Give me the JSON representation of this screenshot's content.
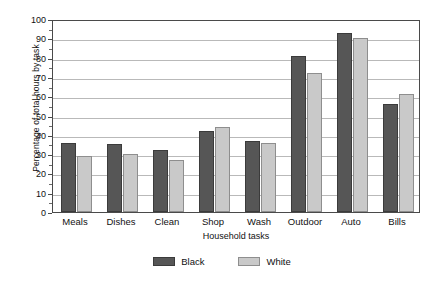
{
  "chart_data": {
    "type": "bar",
    "title": "",
    "subtitle": "",
    "xlabel": "Household tasks",
    "ylabel": "Percentage of total hours by task",
    "categories": [
      "Meals",
      "Dishes",
      "Clean",
      "Shop",
      "Wash",
      "Outdoor",
      "Auto",
      "Bills"
    ],
    "series": [
      {
        "name": "Black",
        "color": "#565656",
        "values": [
          36,
          35,
          32,
          42,
          37,
          81,
          93,
          56
        ]
      },
      {
        "name": "White",
        "color": "#c9c9c9",
        "values": [
          29,
          30,
          27,
          44,
          36,
          72,
          90,
          61
        ]
      }
    ],
    "ylim": [
      0,
      100
    ],
    "ytick_labels": [
      "0",
      "10",
      "20",
      "30",
      "40",
      "50",
      "60",
      "70",
      "80",
      "90",
      "100"
    ],
    "ytick_values": [
      0,
      10,
      20,
      30,
      40,
      50,
      60,
      70,
      80,
      90,
      100
    ],
    "grid": "horizontal",
    "legend_position": "bottom"
  },
  "legend": {
    "items": [
      {
        "label": "Black"
      },
      {
        "label": "White"
      }
    ]
  }
}
